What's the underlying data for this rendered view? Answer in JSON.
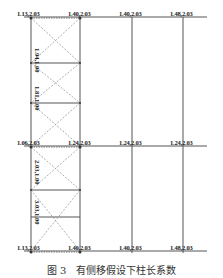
{
  "figure": {
    "caption": "图 3　有侧移假设下柱长系数",
    "columns_x": [
      31,
      80,
      132,
      183
    ],
    "beams_y": [
      17,
      146,
      251
    ],
    "braced_bay": {
      "x1": 31,
      "x2": 80,
      "mid_levels_y": [
        63,
        103,
        190,
        217
      ]
    },
    "colors": {
      "line": "#555555",
      "brace": "#888888",
      "text": "#222222"
    },
    "node_labels": [
      {
        "id": "top-0",
        "text": "1.13,2.03",
        "x": 17,
        "y": 10
      },
      {
        "id": "top-1",
        "text": "1.40,2.03",
        "x": 68,
        "y": 10
      },
      {
        "id": "top-2",
        "text": "1.40,2.03",
        "x": 119,
        "y": 10
      },
      {
        "id": "top-3",
        "text": "1.48,2.03",
        "x": 170,
        "y": 10
      },
      {
        "id": "mid-0",
        "text": "1.06,2.03",
        "x": 17,
        "y": 140
      },
      {
        "id": "mid-1",
        "text": "1.24,2.03",
        "x": 68,
        "y": 140
      },
      {
        "id": "mid-2",
        "text": "1.24,2.03",
        "x": 119,
        "y": 140
      },
      {
        "id": "mid-3",
        "text": "1.24,2.03",
        "x": 170,
        "y": 140
      },
      {
        "id": "bot-0",
        "text": "1.13,2.03",
        "x": 17,
        "y": 244
      },
      {
        "id": "bot-1",
        "text": "1.40,2.03",
        "x": 68,
        "y": 244
      },
      {
        "id": "bot-2",
        "text": "1.40,2.03",
        "x": 119,
        "y": 244
      },
      {
        "id": "bot-3",
        "text": "1.48,2.03",
        "x": 170,
        "y": 244
      }
    ],
    "vertical_labels": [
      {
        "id": "v-0",
        "text": "1.94,1.00",
        "x": 38,
        "y": 48
      },
      {
        "id": "v-1",
        "text": "1.81,1.00",
        "x": 38,
        "y": 88
      },
      {
        "id": "v-2",
        "text": "2.03,1.00",
        "x": 38,
        "y": 168
      },
      {
        "id": "v-3",
        "text": "3.03,1.00",
        "x": 38,
        "y": 200
      }
    ]
  }
}
